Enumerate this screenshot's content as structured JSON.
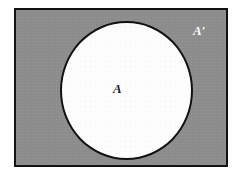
{
  "figure": {
    "type": "venn-diagram",
    "background_color": "#ffffff"
  },
  "universal_set": {
    "name": "universal-set",
    "fill_color": "#8c8c8c",
    "border_color": "#131313",
    "shaded": true,
    "shaded_region_meaning": "complement of A"
  },
  "sets": [
    {
      "id": "A",
      "label": "A",
      "label_color": "#1b1b1b",
      "fill_color": "#fdfdfd",
      "border_color": "#121212",
      "shape": "circle",
      "shaded": false
    },
    {
      "id": "A-complement",
      "label": "A′",
      "label_color": "#ffffff",
      "fill_color": "#8c8c8c",
      "shape": "rectangle-minus-circle",
      "shaded": true
    }
  ],
  "labels": {
    "set_a": "A",
    "set_a_complement": "A′"
  }
}
